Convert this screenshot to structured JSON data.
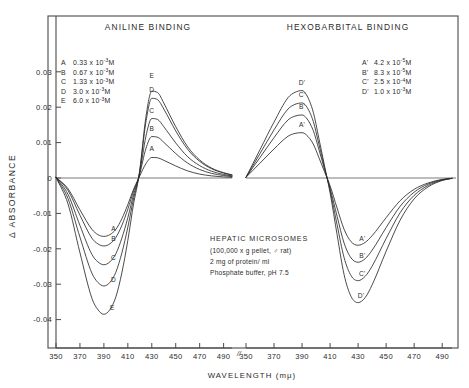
{
  "figure": {
    "background_color": "#ffffff",
    "ink_color": "#2b2b2b",
    "axis_color": "#4a4a4a"
  },
  "axes": {
    "y_axis_label": "Δ ABSORBANCE",
    "y_ticks": [
      "0.03",
      "0.02",
      "0.01",
      "0",
      "-0.01",
      "-0.02",
      "-0.03",
      "-0.04"
    ],
    "y_tick_values": [
      0.03,
      0.02,
      0.01,
      0,
      -0.01,
      -0.02,
      -0.03,
      -0.04
    ],
    "y_limits": [
      -0.045,
      0.036
    ],
    "x_axis_label": "WAVELENGTH (mμ)",
    "x_ticks_left": [
      "350",
      "370",
      "390",
      "410",
      "430",
      "450",
      "470",
      "490"
    ],
    "x_ticks_right": [
      "350",
      "370",
      "390",
      "410",
      "430",
      "450",
      "470",
      "490"
    ],
    "x_limits": [
      350,
      497
    ],
    "axis_break_symbol": "//"
  },
  "panels": [
    {
      "id": "aniline",
      "title": "ANILINE BINDING",
      "legend": [
        {
          "key": "A",
          "coefficient": "0.33",
          "base": "x 10",
          "exponent": "-3",
          "unit": "M"
        },
        {
          "key": "B",
          "coefficient": "0.67",
          "base": "x 10",
          "exponent": "-3",
          "unit": "M"
        },
        {
          "key": "C",
          "coefficient": "1.33",
          "base": "x 10",
          "exponent": "-3",
          "unit": "M"
        },
        {
          "key": "D",
          "coefficient": "3.0",
          "base": "x 10",
          "exponent": "-3",
          "unit": "M"
        },
        {
          "key": "E",
          "coefficient": "6.0",
          "base": "x 10",
          "exponent": "-3",
          "unit": "M"
        }
      ],
      "curve_labels": [
        "A",
        "B",
        "C",
        "D",
        "E"
      ]
    },
    {
      "id": "hexobarbital",
      "title": "HEXOBARBITAL BINDING",
      "legend": [
        {
          "key": "A'",
          "coefficient": "4.2",
          "base": "x 10",
          "exponent": "-5",
          "unit": "M"
        },
        {
          "key": "B'",
          "coefficient": "8.3",
          "base": "x 10",
          "exponent": "-5",
          "unit": "M"
        },
        {
          "key": "C'",
          "coefficient": "2.5",
          "base": "x 10",
          "exponent": "-4",
          "unit": "M"
        },
        {
          "key": "D'",
          "coefficient": "1.0",
          "base": "x 10",
          "exponent": "-3",
          "unit": "M"
        }
      ],
      "curve_labels": [
        "A'",
        "B'",
        "C'",
        "D'"
      ]
    }
  ],
  "annotation": {
    "heading": "HEPATIC MICROSOMES",
    "lines": [
      "(100,000 x g pellet, ♂ rat)",
      "2 mg of protein/ ml",
      "Phosphate buffer, pH 7.5"
    ]
  },
  "chart_data": {
    "type": "line",
    "xlabel": "WAVELENGTH (mμ)",
    "ylabel": "Δ ABSORBANCE",
    "xlim": [
      350,
      497
    ],
    "ylim": [
      -0.045,
      0.036
    ],
    "grid": false,
    "legend_position": "inside-top",
    "panels": [
      {
        "name": "ANILINE BINDING",
        "x": [
          350,
          360,
          370,
          380,
          385,
          390,
          395,
          400,
          405,
          410,
          415,
          418,
          420,
          425,
          430,
          435,
          440,
          445,
          450,
          460,
          470,
          480,
          490,
          497
        ],
        "series": [
          {
            "name": "A",
            "concentration": "0.33x10-3 M",
            "peak_nm": 430,
            "peak_value": 0.0058,
            "trough_nm": 393,
            "trough_value": -0.0165,
            "values": [
              0.0002,
              -0.003,
              -0.009,
              -0.0145,
              -0.016,
              -0.0165,
              -0.016,
              -0.0145,
              -0.0115,
              -0.0075,
              -0.003,
              -0.0008,
              0.0006,
              0.004,
              0.0058,
              0.0057,
              0.005,
              0.0042,
              0.0034,
              0.002,
              0.0011,
              0.0006,
              0.0003,
              0.0002
            ]
          },
          {
            "name": "B",
            "concentration": "0.67x10-3 M",
            "peak_nm": 430,
            "peak_value": 0.0117,
            "trough_nm": 393,
            "trough_value": -0.0192,
            "values": [
              0.0002,
              -0.0035,
              -0.0105,
              -0.017,
              -0.0186,
              -0.0192,
              -0.0186,
              -0.0168,
              -0.0134,
              -0.0088,
              -0.0035,
              -0.001,
              0.0012,
              0.0082,
              0.0117,
              0.0115,
              0.0101,
              0.0085,
              0.0069,
              0.0042,
              0.0024,
              0.0013,
              0.0007,
              0.0004
            ]
          },
          {
            "name": "C",
            "concentration": "1.33x10-3 M",
            "peak_nm": 430,
            "peak_value": 0.0168,
            "trough_nm": 393,
            "trough_value": -0.0245,
            "values": [
              0.0002,
              -0.0046,
              -0.0134,
              -0.0216,
              -0.0237,
              -0.0245,
              -0.0237,
              -0.0214,
              -0.017,
              -0.0112,
              -0.0044,
              -0.0012,
              0.0016,
              0.0116,
              0.0168,
              0.0165,
              0.0145,
              0.0122,
              0.0099,
              0.006,
              0.0035,
              0.0019,
              0.001,
              0.0006
            ]
          },
          {
            "name": "D",
            "concentration": "3.0x10-3 M",
            "peak_nm": 430,
            "peak_value": 0.0225,
            "trough_nm": 393,
            "trough_value": -0.0305,
            "values": [
              0.0002,
              -0.0058,
              -0.0167,
              -0.0269,
              -0.0295,
              -0.0305,
              -0.0295,
              -0.0266,
              -0.0212,
              -0.0139,
              -0.0055,
              -0.0015,
              0.0021,
              0.0156,
              0.0225,
              0.0221,
              0.0195,
              0.0164,
              0.0133,
              0.0081,
              0.0047,
              0.0026,
              0.0014,
              0.0008
            ]
          },
          {
            "name": "E",
            "concentration": "6.0x10-3 M",
            "peak_nm": 430,
            "peak_value": 0.0245,
            "trough_nm": 393,
            "trough_value": -0.0385,
            "values": [
              0.0002,
              -0.0073,
              -0.0211,
              -0.034,
              -0.0372,
              -0.0385,
              -0.0372,
              -0.0336,
              -0.0268,
              -0.0176,
              -0.0069,
              -0.0019,
              0.0023,
              0.017,
              0.0245,
              0.0241,
              0.0212,
              0.0178,
              0.0145,
              0.0088,
              0.0051,
              0.0028,
              0.0015,
              0.0009
            ]
          }
        ]
      },
      {
        "name": "HEXOBARBITAL BINDING",
        "x": [
          350,
          360,
          370,
          380,
          385,
          390,
          393,
          398,
          402,
          406,
          410,
          415,
          420,
          425,
          430,
          435,
          440,
          450,
          460,
          470,
          480,
          490,
          497
        ],
        "series": [
          {
            "name": "A'",
            "concentration": "4.2x10-5 M",
            "peak_nm": 390,
            "peak_value": 0.0128,
            "trough_nm": 428,
            "trough_value": -0.019,
            "values": [
              0.0002,
              0.0042,
              0.0082,
              0.0118,
              0.0126,
              0.0128,
              0.0122,
              0.0096,
              0.0058,
              0.0018,
              -0.0022,
              -0.0085,
              -0.0145,
              -0.018,
              -0.019,
              -0.0182,
              -0.0163,
              -0.0112,
              -0.0064,
              -0.0032,
              -0.0014,
              -0.0004,
              -0.0001
            ]
          },
          {
            "name": "B'",
            "concentration": "8.3x10-5 M",
            "peak_nm": 390,
            "peak_value": 0.0178,
            "trough_nm": 428,
            "trough_value": -0.0238,
            "values": [
              0.0002,
              0.0058,
              0.0114,
              0.0164,
              0.0175,
              0.0178,
              0.017,
              0.0134,
              0.0081,
              0.0025,
              -0.0029,
              -0.0108,
              -0.0184,
              -0.0226,
              -0.0238,
              -0.0228,
              -0.0204,
              -0.014,
              -0.008,
              -0.004,
              -0.0017,
              -0.0005,
              -0.0001
            ]
          },
          {
            "name": "C'",
            "concentration": "2.5x10-4 M",
            "peak_nm": 390,
            "peak_value": 0.0212,
            "trough_nm": 428,
            "trough_value": -0.029,
            "values": [
              0.0002,
              0.0069,
              0.0136,
              0.0195,
              0.0208,
              0.0212,
              0.0203,
              0.016,
              0.0096,
              0.003,
              -0.0035,
              -0.0132,
              -0.0225,
              -0.0276,
              -0.029,
              -0.0278,
              -0.0249,
              -0.0171,
              -0.0098,
              -0.0049,
              -0.0021,
              -0.0006,
              -0.0001
            ]
          },
          {
            "name": "D'",
            "concentration": "1.0x10-3 M",
            "peak_nm": 390,
            "peak_value": 0.0247,
            "trough_nm": 428,
            "trough_value": -0.0352,
            "values": [
              0.0002,
              0.008,
              0.0158,
              0.0227,
              0.0242,
              0.0247,
              0.0236,
              0.0186,
              0.0112,
              0.0035,
              -0.0042,
              -0.016,
              -0.0273,
              -0.0335,
              -0.0352,
              -0.0338,
              -0.0302,
              -0.0207,
              -0.0119,
              -0.0059,
              -0.0025,
              -0.0007,
              -0.0001
            ]
          }
        ]
      }
    ]
  }
}
